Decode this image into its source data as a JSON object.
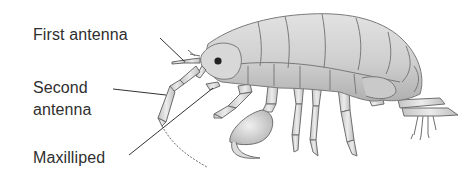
{
  "figure": {
    "labels": [
      {
        "id": "first-antenna",
        "text": "First antenna"
      },
      {
        "id": "second-antenna",
        "lines": [
          "Second",
          "antenna"
        ]
      },
      {
        "id": "maxilliped",
        "text": "Maxilliped"
      }
    ],
    "colors": {
      "background": "#ffffff",
      "label_text": "#2f2f2f",
      "leader_line": "#333333",
      "body_fill": "#d4d4d4",
      "body_shade": "#b8b8b8",
      "outline": "#7a7a7a"
    }
  }
}
